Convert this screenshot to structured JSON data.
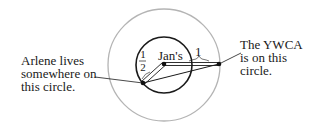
{
  "diagram": {
    "outer_circle": {
      "cx": 164,
      "cy": 65,
      "r": 56,
      "color": "#b4b4b4"
    },
    "inner_circle": {
      "cx": 164,
      "cy": 65,
      "r": 28,
      "color": "#1a1a1a"
    },
    "points": {
      "jans": {
        "x": 164,
        "y": 64,
        "label": "Jan's"
      },
      "arlene": {
        "x": 143,
        "y": 83
      },
      "ywca": {
        "x": 219,
        "y": 64
      }
    },
    "labels": {
      "arlene_line1": "Arlene lives",
      "arlene_line2": "somewhere on",
      "arlene_line3": "this circle.",
      "ywca_line1": "The YWCA",
      "ywca_line2": "is on this",
      "ywca_line3": "circle.",
      "jans": "Jan's",
      "distance_one": "1",
      "half_num": "1",
      "half_den": "2"
    }
  }
}
